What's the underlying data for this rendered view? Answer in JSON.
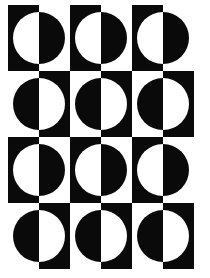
{
  "artwork": {
    "title": "Op-Art Circle Grid",
    "type": "geometric-pattern",
    "style": "op-art",
    "canvas": {
      "width": 210,
      "height": 278,
      "background_color": "#ffffff"
    },
    "colors": {
      "ink": "#0a0a0a",
      "paper": "#ffffff"
    },
    "grid": {
      "columns": 3,
      "rows": 4,
      "cell_width": 62,
      "cell_height": 66,
      "half_width": 31,
      "origin_x": 8,
      "origin_y": 5,
      "column_x": [
        8,
        70,
        132
      ],
      "row_y": [
        5,
        71,
        137,
        203
      ]
    },
    "motif": {
      "name": "split-square-with-inscribed-circle",
      "description": "Square split vertically into two equal half-rectangles of opposite tone; a circle centered on the split line is rendered in the inverse tone of whichever half it overlaps.",
      "circle_radius": 26,
      "circle_center_offset_x": 31,
      "circle_center_offset_y": 33
    },
    "cells": [
      {
        "row": 0,
        "col": 0,
        "left_tone": "ink",
        "right_tone": "paper"
      },
      {
        "row": 0,
        "col": 1,
        "left_tone": "ink",
        "right_tone": "paper"
      },
      {
        "row": 0,
        "col": 2,
        "left_tone": "ink",
        "right_tone": "paper"
      },
      {
        "row": 1,
        "col": 0,
        "left_tone": "paper",
        "right_tone": "ink"
      },
      {
        "row": 1,
        "col": 1,
        "left_tone": "paper",
        "right_tone": "ink"
      },
      {
        "row": 1,
        "col": 2,
        "left_tone": "paper",
        "right_tone": "ink"
      },
      {
        "row": 2,
        "col": 0,
        "left_tone": "ink",
        "right_tone": "paper"
      },
      {
        "row": 2,
        "col": 1,
        "left_tone": "ink",
        "right_tone": "paper"
      },
      {
        "row": 2,
        "col": 2,
        "left_tone": "ink",
        "right_tone": "paper"
      },
      {
        "row": 3,
        "col": 0,
        "left_tone": "paper",
        "right_tone": "ink"
      },
      {
        "row": 3,
        "col": 1,
        "left_tone": "paper",
        "right_tone": "ink"
      },
      {
        "row": 3,
        "col": 2,
        "left_tone": "paper",
        "right_tone": "ink"
      }
    ]
  }
}
